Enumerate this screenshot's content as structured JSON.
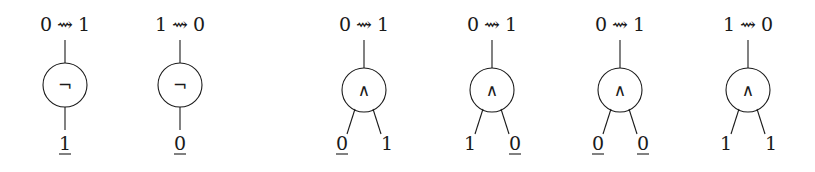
{
  "diagram": {
    "squiggle_arrow": "⇝",
    "gates": [
      {
        "id": "not-1",
        "type": "not",
        "symbol": "¬",
        "cx": 65,
        "transition": {
          "from": "0",
          "to": "1"
        },
        "inputs": [
          {
            "value": "1",
            "underlined": true
          }
        ]
      },
      {
        "id": "not-2",
        "type": "not",
        "symbol": "¬",
        "cx": 180,
        "transition": {
          "from": "1",
          "to": "0"
        },
        "inputs": [
          {
            "value": "0",
            "underlined": true
          }
        ]
      },
      {
        "id": "and-1",
        "type": "and",
        "symbol": "∧",
        "cx": 364,
        "transition": {
          "from": "0",
          "to": "1"
        },
        "inputs": [
          {
            "value": "0",
            "underlined": true
          },
          {
            "value": "1",
            "underlined": false
          }
        ]
      },
      {
        "id": "and-2",
        "type": "and",
        "symbol": "∧",
        "cx": 492,
        "transition": {
          "from": "0",
          "to": "1"
        },
        "inputs": [
          {
            "value": "1",
            "underlined": false
          },
          {
            "value": "0",
            "underlined": true
          }
        ]
      },
      {
        "id": "and-3",
        "type": "and",
        "symbol": "∧",
        "cx": 620,
        "transition": {
          "from": "0",
          "to": "1"
        },
        "inputs": [
          {
            "value": "0",
            "underlined": true
          },
          {
            "value": "0",
            "underlined": true
          }
        ]
      },
      {
        "id": "and-4",
        "type": "and",
        "symbol": "∧",
        "cx": 748,
        "transition": {
          "from": "1",
          "to": "0"
        },
        "inputs": [
          {
            "value": "1",
            "underlined": false
          },
          {
            "value": "1",
            "underlined": false
          }
        ]
      }
    ]
  }
}
